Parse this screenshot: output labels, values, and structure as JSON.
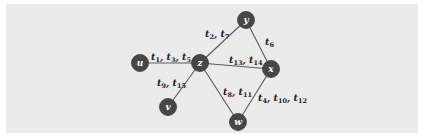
{
  "diagram": {
    "type": "temporal-graph",
    "background": "#ebebeb",
    "node_color": "#474747",
    "edge_color": "#5a5a5a",
    "nodes": [
      {
        "id": "u",
        "label": "u",
        "x": 140,
        "y": 63
      },
      {
        "id": "z",
        "label": "z",
        "x": 200,
        "y": 63
      },
      {
        "id": "y",
        "label": "y",
        "x": 246,
        "y": 20
      },
      {
        "id": "x",
        "label": "x",
        "x": 271,
        "y": 69
      },
      {
        "id": "v",
        "label": "v",
        "x": 168,
        "y": 107
      },
      {
        "id": "w",
        "label": "w",
        "x": 238,
        "y": 122
      }
    ],
    "edges": [
      {
        "from": "u",
        "to": "z",
        "label": "t1, t3, t5",
        "times": [
          1,
          3,
          5
        ]
      },
      {
        "from": "z",
        "to": "y",
        "label": "t2, t7",
        "times": [
          2,
          7
        ]
      },
      {
        "from": "y",
        "to": "x",
        "label": "t6",
        "times": [
          6
        ]
      },
      {
        "from": "z",
        "to": "x",
        "label": "t13, t14",
        "times": [
          13,
          14
        ]
      },
      {
        "from": "z",
        "to": "v",
        "label": "t9, t15",
        "times": [
          9,
          15
        ]
      },
      {
        "from": "z",
        "to": "w",
        "label": "t8, t11",
        "times": [
          8,
          11
        ]
      },
      {
        "from": "x",
        "to": "w",
        "label": "t4, t10, t12",
        "times": [
          4,
          10,
          12
        ]
      }
    ]
  },
  "caption": ""
}
